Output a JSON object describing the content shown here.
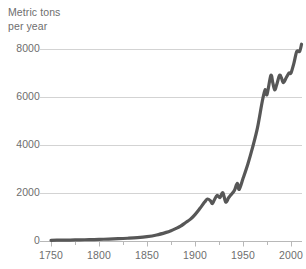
{
  "chart_data": {
    "type": "line",
    "title": "",
    "subtitle": "",
    "ylabel": "Metric tons\nper year",
    "ylabel_line1": "Metric tons",
    "ylabel_line2": "per year",
    "xlabel": "",
    "xlim": [
      1740,
      2015
    ],
    "ylim": [
      0,
      8000
    ],
    "grid": true,
    "grid_axis": "y",
    "legend": false,
    "legend_position": "none",
    "yticks": [
      0,
      2000,
      4000,
      6000,
      8000
    ],
    "ytick_labels": [
      "0",
      "2000",
      "4000",
      "6000",
      "8000"
    ],
    "xticks": [
      1750,
      1800,
      1850,
      1900,
      1950,
      2000
    ],
    "xtick_labels": [
      "1750",
      "1800",
      "1850",
      "1900",
      "1950",
      "2000"
    ],
    "xtick_minor_step": 25,
    "series": [
      {
        "name": "Metric tons per year",
        "color": "#575757",
        "line_width": 3.2,
        "x": [
          1750,
          1760,
          1770,
          1780,
          1790,
          1800,
          1810,
          1820,
          1830,
          1840,
          1850,
          1860,
          1870,
          1875,
          1880,
          1885,
          1890,
          1895,
          1900,
          1905,
          1910,
          1913,
          1916,
          1918,
          1920,
          1923,
          1926,
          1929,
          1932,
          1935,
          1938,
          1941,
          1944,
          1946,
          1950,
          1955,
          1960,
          1965,
          1970,
          1973,
          1975,
          1979,
          1981,
          1983,
          1985,
          1988,
          1990,
          1992,
          1995,
          1998,
          2000,
          2003,
          2006,
          2009,
          2011
        ],
        "y": [
          30,
          35,
          40,
          48,
          55,
          65,
          80,
          95,
          115,
          140,
          180,
          250,
          360,
          430,
          520,
          620,
          760,
          900,
          1100,
          1350,
          1620,
          1750,
          1680,
          1560,
          1700,
          1900,
          1810,
          2010,
          1620,
          1800,
          1950,
          2100,
          2400,
          2150,
          2600,
          3200,
          3900,
          4700,
          5800,
          6300,
          6100,
          6900,
          6600,
          6300,
          6500,
          6900,
          6800,
          6600,
          6800,
          7000,
          7000,
          7400,
          7900,
          7900,
          8200
        ],
        "y_display_max_note": "curve peaks near 6800 on this axis"
      }
    ],
    "annotations": []
  },
  "colors": {
    "line": "#575757",
    "grid": "#d3d3d3",
    "axis": "#b8b8b8",
    "text": "#6e6e6e",
    "background": "#ffffff"
  }
}
